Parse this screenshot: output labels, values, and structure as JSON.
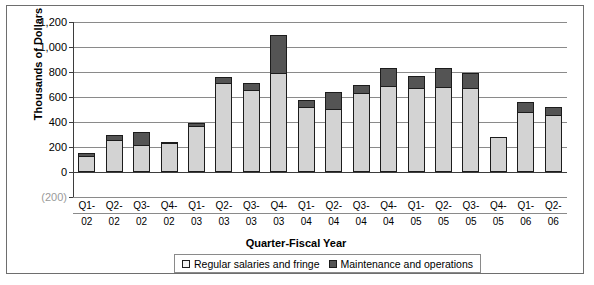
{
  "chart_data": {
    "type": "bar",
    "subtype": "stacked-column",
    "title": "",
    "xlabel": "Quarter-Fiscal Year",
    "ylabel": "Thousands of Dollars",
    "ylim": [
      -200,
      1200
    ],
    "ytick_values": [
      1200,
      1000,
      800,
      600,
      400,
      200,
      0,
      -200
    ],
    "ytick_labels": [
      "1,200",
      "1,000",
      "800",
      "600",
      "400",
      "200",
      "0",
      "(200)"
    ],
    "grid": true,
    "legend_position": "bottom",
    "categories": [
      "Q1-02",
      "Q2-02",
      "Q3-02",
      "Q4-02",
      "Q1-03",
      "Q2-03",
      "Q3-03",
      "Q4-03",
      "Q1-04",
      "Q2-04",
      "Q3-04",
      "Q4-04",
      "Q1-05",
      "Q2-05",
      "Q3-05",
      "Q4-05",
      "Q1-06",
      "Q2-06"
    ],
    "category_lines": [
      [
        "Q1-",
        "02"
      ],
      [
        "Q2-",
        "02"
      ],
      [
        "Q3-",
        "02"
      ],
      [
        "Q4-",
        "02"
      ],
      [
        "Q1-",
        "03"
      ],
      [
        "Q2-",
        "03"
      ],
      [
        "Q3-",
        "03"
      ],
      [
        "Q4-",
        "03"
      ],
      [
        "Q1-",
        "04"
      ],
      [
        "Q2-",
        "04"
      ],
      [
        "Q3-",
        "04"
      ],
      [
        "Q4-",
        "04"
      ],
      [
        "Q1-",
        "05"
      ],
      [
        "Q2-",
        "05"
      ],
      [
        "Q3-",
        "05"
      ],
      [
        "Q4-",
        "05"
      ],
      [
        "Q1-",
        "06"
      ],
      [
        "Q2-",
        "06"
      ]
    ],
    "series": [
      {
        "name": "Regular salaries and fringe",
        "color": "#d3d3d3",
        "values": [
          125,
          255,
          215,
          235,
          365,
          710,
          660,
          790,
          520,
          505,
          630,
          685,
          670,
          680,
          670,
          280,
          480,
          460
        ]
      },
      {
        "name": "Maintenance and operations",
        "color": "#545454",
        "values": [
          25,
          40,
          105,
          5,
          25,
          50,
          50,
          310,
          55,
          135,
          70,
          150,
          95,
          150,
          125,
          0,
          80,
          60
        ]
      }
    ],
    "totals": [
      150,
      295,
      320,
      240,
      390,
      760,
      710,
      1100,
      575,
      640,
      700,
      835,
      765,
      830,
      795,
      280,
      560,
      520
    ]
  },
  "legend": {
    "entries": [
      {
        "label": "Regular salaries and fringe",
        "swatch": "light"
      },
      {
        "label": "Maintenance and operations",
        "swatch": "dark"
      }
    ]
  },
  "caption_fragment": ""
}
